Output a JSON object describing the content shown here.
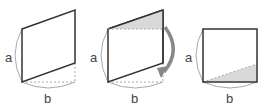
{
  "diagram": {
    "colors": {
      "stroke": "#333333",
      "guide": "#aaaaaa",
      "shade": "#d9d9d9",
      "arrow": "#888888",
      "label": "#444444"
    },
    "figures": [
      {
        "id": "parallelogram",
        "label_a": "a",
        "label_b": "b"
      },
      {
        "id": "parallelogram-cut",
        "label_a": "a",
        "label_b": "b"
      },
      {
        "id": "rectangle-result",
        "label_a": "a",
        "label_b": "b"
      }
    ]
  }
}
